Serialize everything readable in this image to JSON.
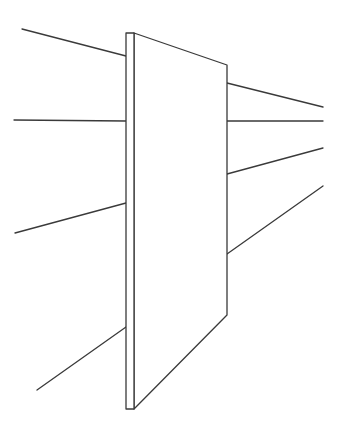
{
  "diagram": {
    "stroke_color": "#3a3a3a",
    "background": "#ffffff",
    "panel": {
      "edge_strip": [
        [
          126,
          33
        ],
        [
          134,
          33
        ],
        [
          134,
          409
        ],
        [
          126,
          409
        ]
      ],
      "face": [
        [
          134,
          33
        ],
        [
          227,
          65
        ],
        [
          227,
          315
        ],
        [
          134,
          409
        ]
      ]
    },
    "left_lines": [
      {
        "from": [
          22,
          29
        ],
        "to": [
          126,
          56
        ]
      },
      {
        "from": [
          14,
          120
        ],
        "to": [
          126,
          121
        ]
      },
      {
        "from": [
          15,
          233
        ],
        "to": [
          126,
          203
        ]
      },
      {
        "from": [
          37,
          390
        ],
        "to": [
          126,
          327
        ]
      }
    ],
    "right_lines": [
      {
        "from": [
          227,
          83
        ],
        "to": [
          323,
          107
        ]
      },
      {
        "from": [
          227,
          121
        ],
        "to": [
          323,
          121
        ]
      },
      {
        "from": [
          227,
          174
        ],
        "to": [
          323,
          148
        ]
      },
      {
        "from": [
          227,
          254
        ],
        "to": [
          323,
          186
        ]
      }
    ]
  }
}
